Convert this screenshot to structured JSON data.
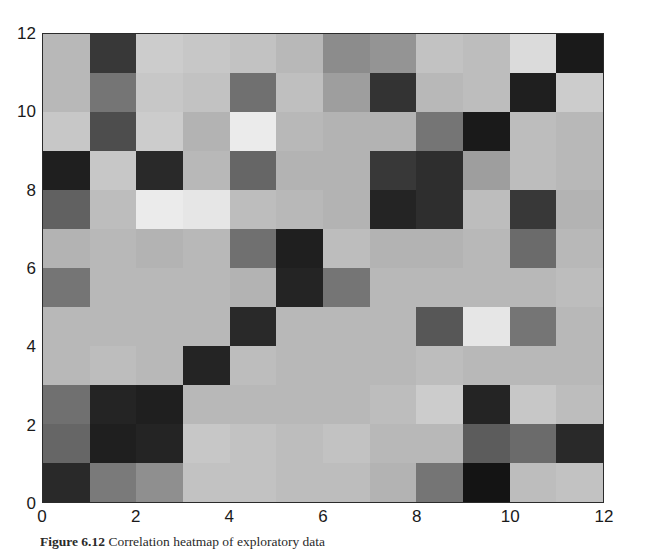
{
  "figure": {
    "type": "heatmap",
    "caption_label": "Figure 6.12",
    "caption_text": "Correlation heatmap of exploratory data",
    "caption_full": "Figure 6.12  Correlation heatmap of exploratory data"
  },
  "axes": {
    "x_ticks": [
      "0",
      "2",
      "4",
      "6",
      "8",
      "10",
      "12"
    ],
    "y_ticks": [
      "0",
      "2",
      "4",
      "6",
      "8",
      "10",
      "12"
    ],
    "xlabel": "",
    "ylabel": "",
    "xlim": [
      0,
      12
    ],
    "ylim": [
      0,
      12
    ],
    "grid": false,
    "frame_color": "#2b2b2b"
  },
  "colormap": {
    "name": "gray",
    "vmin": 0,
    "vmax": 1,
    "low_color": "#111111",
    "high_color": "#f2f2f2"
  },
  "chart_data": {
    "type": "heatmap",
    "title": "",
    "xlabel": "",
    "ylabel": "",
    "xlim": [
      0,
      12
    ],
    "ylim": [
      0,
      12
    ],
    "grid": false,
    "legend": "none",
    "colormap": "gray",
    "vmin": 0.0,
    "vmax": 1.0,
    "x_categories": [
      "0",
      "1",
      "2",
      "3",
      "4",
      "5",
      "6",
      "7",
      "8",
      "9",
      "10",
      "11"
    ],
    "y_categories": [
      "0",
      "1",
      "2",
      "3",
      "4",
      "5",
      "6",
      "7",
      "8",
      "9",
      "10",
      "11"
    ],
    "x_tick_labels": [
      "0",
      "2",
      "4",
      "6",
      "8",
      "10",
      "12"
    ],
    "y_tick_labels": [
      "0",
      "2",
      "4",
      "6",
      "8",
      "10",
      "12"
    ],
    "row_order": "top_row_is_y_11",
    "rows_top_to_bottom": [
      {
        "y": 11,
        "values": [
          0.72,
          0.22,
          0.8,
          0.78,
          0.76,
          0.72,
          0.55,
          0.58,
          0.76,
          0.74,
          0.86,
          0.1
        ]
      },
      {
        "y": 10,
        "values": [
          0.72,
          0.46,
          0.78,
          0.76,
          0.44,
          0.75,
          0.62,
          0.2,
          0.72,
          0.74,
          0.12,
          0.8
        ]
      },
      {
        "y": 9,
        "values": [
          0.78,
          0.3,
          0.8,
          0.7,
          0.92,
          0.72,
          0.7,
          0.7,
          0.46,
          0.1,
          0.74,
          0.72
        ]
      },
      {
        "y": 8,
        "values": [
          0.12,
          0.78,
          0.16,
          0.72,
          0.4,
          0.7,
          0.7,
          0.22,
          0.18,
          0.62,
          0.74,
          0.72
        ]
      },
      {
        "y": 7,
        "values": [
          0.38,
          0.74,
          0.92,
          0.9,
          0.74,
          0.72,
          0.7,
          0.14,
          0.18,
          0.74,
          0.22,
          0.7
        ]
      },
      {
        "y": 6,
        "values": [
          0.7,
          0.72,
          0.7,
          0.72,
          0.44,
          0.12,
          0.74,
          0.7,
          0.7,
          0.72,
          0.42,
          0.72
        ]
      },
      {
        "y": 5,
        "values": [
          0.46,
          0.72,
          0.72,
          0.72,
          0.7,
          0.14,
          0.46,
          0.72,
          0.72,
          0.72,
          0.72,
          0.74
        ]
      },
      {
        "y": 4,
        "values": [
          0.72,
          0.72,
          0.72,
          0.72,
          0.16,
          0.72,
          0.72,
          0.72,
          0.34,
          0.9,
          0.46,
          0.72
        ]
      },
      {
        "y": 3,
        "values": [
          0.72,
          0.74,
          0.72,
          0.14,
          0.74,
          0.72,
          0.72,
          0.72,
          0.74,
          0.72,
          0.72,
          0.72
        ]
      },
      {
        "y": 2,
        "values": [
          0.44,
          0.14,
          0.12,
          0.72,
          0.72,
          0.72,
          0.72,
          0.74,
          0.8,
          0.14,
          0.78,
          0.74
        ]
      },
      {
        "y": 1,
        "values": [
          0.4,
          0.12,
          0.14,
          0.78,
          0.76,
          0.74,
          0.76,
          0.72,
          0.72,
          0.36,
          0.42,
          0.16
        ]
      },
      {
        "y": 0,
        "values": [
          0.16,
          0.48,
          0.56,
          0.76,
          0.76,
          0.74,
          0.74,
          0.7,
          0.46,
          0.08,
          0.74,
          0.76
        ]
      }
    ]
  }
}
